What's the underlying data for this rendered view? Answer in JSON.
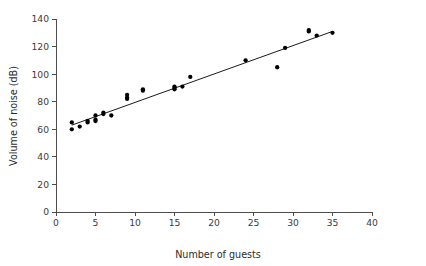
{
  "chart_data": {
    "type": "scatter",
    "title": "",
    "xlabel": "Number of guests",
    "ylabel": "Volume of noise (dB)",
    "xlim": [
      0,
      40
    ],
    "ylim": [
      0,
      140
    ],
    "xticks": [
      0,
      5,
      10,
      15,
      20,
      25,
      30,
      35,
      40
    ],
    "yticks": [
      0,
      20,
      40,
      60,
      80,
      100,
      120,
      140
    ],
    "grid": false,
    "legend": null,
    "marker_color": "#000000",
    "line_color": "#000000",
    "axis_color": "#4d4d4d",
    "points": [
      {
        "x": 2,
        "y": 60
      },
      {
        "x": 2,
        "y": 65
      },
      {
        "x": 3,
        "y": 62
      },
      {
        "x": 4,
        "y": 65
      },
      {
        "x": 4,
        "y": 66
      },
      {
        "x": 5,
        "y": 66
      },
      {
        "x": 5,
        "y": 67
      },
      {
        "x": 5,
        "y": 70
      },
      {
        "x": 6,
        "y": 71
      },
      {
        "x": 6,
        "y": 72
      },
      {
        "x": 7,
        "y": 70
      },
      {
        "x": 9,
        "y": 82
      },
      {
        "x": 9,
        "y": 83
      },
      {
        "x": 9,
        "y": 85
      },
      {
        "x": 11,
        "y": 88
      },
      {
        "x": 11,
        "y": 89
      },
      {
        "x": 15,
        "y": 89
      },
      {
        "x": 15,
        "y": 90
      },
      {
        "x": 15,
        "y": 91
      },
      {
        "x": 16,
        "y": 91
      },
      {
        "x": 17,
        "y": 98
      },
      {
        "x": 24,
        "y": 110
      },
      {
        "x": 28,
        "y": 105
      },
      {
        "x": 29,
        "y": 119
      },
      {
        "x": 32,
        "y": 131
      },
      {
        "x": 32,
        "y": 132
      },
      {
        "x": 33,
        "y": 128
      },
      {
        "x": 35,
        "y": 130
      }
    ],
    "trend_line": {
      "x_start": 2,
      "y_start": 63,
      "x_end": 35,
      "y_end": 131
    }
  }
}
